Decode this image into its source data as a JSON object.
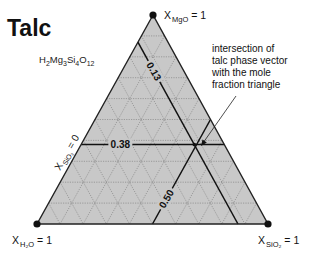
{
  "title": "Talc",
  "formula": {
    "parts": [
      {
        "t": "H",
        "sub": false
      },
      {
        "t": "2",
        "sub": true
      },
      {
        "t": "Mg",
        "sub": false
      },
      {
        "t": "3",
        "sub": true
      },
      {
        "t": "Si",
        "sub": false
      },
      {
        "t": "4",
        "sub": true
      },
      {
        "t": "O",
        "sub": false
      },
      {
        "t": "12",
        "sub": true
      }
    ]
  },
  "vertices": {
    "top": {
      "base": "X",
      "sub": "MgO",
      "rest": " = 1"
    },
    "left": {
      "base": "X",
      "sub": "H₂O",
      "rest": " = 1"
    },
    "right": {
      "base": "X",
      "sub": "SiO₂",
      "rest": " = 1"
    }
  },
  "left_edge_label": {
    "base": "X",
    "sub": "SiO₂",
    "rest": " = 0"
  },
  "grid_divisions": 10,
  "colors": {
    "fill": "#c8c8c8",
    "edge": "#222222",
    "grid": "#7a7a7a",
    "thick": "#111111"
  },
  "phase_lines": [
    {
      "id": "mgo-line",
      "component": "MgO",
      "value": 0.38,
      "label": "0.38"
    },
    {
      "id": "h2o-line",
      "component": "H2O",
      "value": 0.13,
      "label": "0.13"
    },
    {
      "id": "sio2-line",
      "component": "SiO2",
      "value": 0.5,
      "label": "0.50"
    }
  ],
  "annotation": {
    "lines": [
      "intersection of",
      "talc phase vector",
      "with the mole",
      "fraction triangle"
    ]
  }
}
